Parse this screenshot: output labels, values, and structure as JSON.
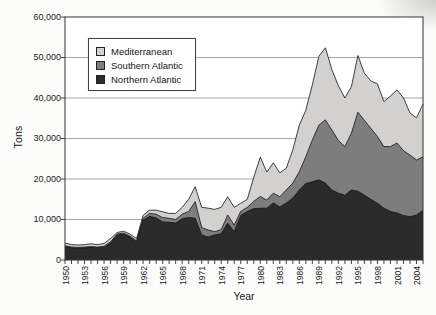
{
  "chart_data": {
    "type": "area",
    "stacked": true,
    "xlabel": "Year",
    "ylabel": "Tons",
    "ylim": [
      0,
      60000
    ],
    "y_tick_step": 10000,
    "y_tick_labels": [
      "0",
      "10,000",
      "20,000",
      "30,000",
      "40,000",
      "50,000",
      "60,000"
    ],
    "x_tick_label_step": 3,
    "x_tick_labels": [
      "1950",
      "1953",
      "1956",
      "1959",
      "1962",
      "1965",
      "1968",
      "1971",
      "1974",
      "1977",
      "1980",
      "1983",
      "1986",
      "1989",
      "1992",
      "1995",
      "1998",
      "2001",
      "2004"
    ],
    "years": [
      1950,
      1951,
      1952,
      1953,
      1954,
      1955,
      1956,
      1957,
      1958,
      1959,
      1960,
      1961,
      1962,
      1963,
      1964,
      1965,
      1966,
      1967,
      1968,
      1969,
      1970,
      1971,
      1972,
      1973,
      1974,
      1975,
      1976,
      1977,
      1978,
      1979,
      1980,
      1981,
      1982,
      1983,
      1984,
      1985,
      1986,
      1987,
      1988,
      1989,
      1990,
      1991,
      1992,
      1993,
      1994,
      1995,
      1996,
      1997,
      1998,
      1999,
      2000,
      2001,
      2002,
      2003,
      2004,
      2005
    ],
    "legend_position": "top-left-inside",
    "grid": true,
    "series": [
      {
        "name": "Northern Atlantic",
        "color": "#2b2b2b",
        "values": [
          3300,
          3000,
          2900,
          3000,
          3100,
          3000,
          3100,
          4200,
          6200,
          6400,
          5600,
          4400,
          9800,
          10800,
          10400,
          9400,
          9300,
          9100,
          10200,
          10500,
          10300,
          6200,
          5700,
          6200,
          6500,
          9100,
          7000,
          11000,
          12000,
          12700,
          12800,
          12800,
          14100,
          13100,
          14100,
          15300,
          17300,
          18900,
          19300,
          19800,
          19000,
          17300,
          16500,
          16000,
          17300,
          17000,
          16000,
          15000,
          14000,
          12800,
          12000,
          11600,
          11000,
          10700,
          11100,
          12300
        ]
      },
      {
        "name": "Southern Atlantic",
        "color": "#7d7d7d",
        "values": [
          200,
          200,
          200,
          200,
          200,
          200,
          300,
          300,
          200,
          300,
          300,
          300,
          500,
          700,
          900,
          1100,
          1000,
          900,
          1100,
          1500,
          4100,
          1800,
          1700,
          800,
          1000,
          2000,
          1600,
          1000,
          1000,
          1800,
          2900,
          2000,
          2400,
          2500,
          3200,
          3700,
          4500,
          6600,
          10300,
          13500,
          15600,
          14800,
          13000,
          12000,
          14000,
          19500,
          18500,
          17500,
          16500,
          15200,
          16000,
          17300,
          16000,
          15200,
          13600,
          13200
        ]
      },
      {
        "name": "Mediterranean",
        "color": "#d2d1d0",
        "values": [
          700,
          600,
          600,
          600,
          700,
          600,
          700,
          800,
          400,
          400,
          500,
          600,
          700,
          800,
          1000,
          1400,
          1200,
          1500,
          1700,
          3000,
          3700,
          5000,
          5400,
          5500,
          5500,
          4500,
          4400,
          2000,
          2000,
          6000,
          9700,
          6900,
          7500,
          5900,
          5400,
          8200,
          11500,
          11500,
          13600,
          17000,
          17800,
          14900,
          13500,
          12000,
          11500,
          14000,
          11600,
          11700,
          13000,
          11100,
          12500,
          13100,
          13000,
          10400,
          10400,
          13000
        ]
      }
    ]
  },
  "legend": {
    "items": [
      {
        "label": "Mediterranean"
      },
      {
        "label": "Southern Atlantic"
      },
      {
        "label": "Northern Atlantic"
      }
    ]
  }
}
